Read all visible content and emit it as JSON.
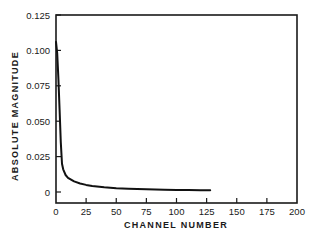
{
  "chart_data": {
    "type": "line",
    "title": "",
    "xlabel": "CHANNEL NUMBER",
    "ylabel": "ABSOLUTE MAGNITUDE",
    "xlim": [
      0,
      200
    ],
    "ylim": [
      -0.008,
      0.125
    ],
    "xticks": [
      0,
      25,
      50,
      75,
      100,
      125,
      150,
      175,
      200
    ],
    "xtick_labels": [
      "0",
      "25",
      "50",
      "75",
      "100",
      "125",
      "150",
      "175",
      "200"
    ],
    "yticks": [
      0,
      0.025,
      0.05,
      0.075,
      0.1,
      0.125
    ],
    "ytick_labels": [
      "0",
      "0.025",
      "0.050",
      "0.075",
      "0.100",
      "0.125"
    ],
    "grid": false,
    "legend": null,
    "series": [
      {
        "name": "magnitude",
        "x": [
          0,
          1,
          2,
          3,
          4,
          5,
          6,
          8,
          10,
          15,
          20,
          25,
          30,
          40,
          50,
          60,
          75,
          90,
          100,
          110,
          120,
          128
        ],
        "y": [
          0.106,
          0.098,
          0.08,
          0.058,
          0.035,
          0.02,
          0.016,
          0.012,
          0.01,
          0.0075,
          0.006,
          0.005,
          0.0042,
          0.0033,
          0.0027,
          0.0023,
          0.0019,
          0.0016,
          0.0015,
          0.0014,
          0.0013,
          0.0012
        ]
      }
    ]
  }
}
